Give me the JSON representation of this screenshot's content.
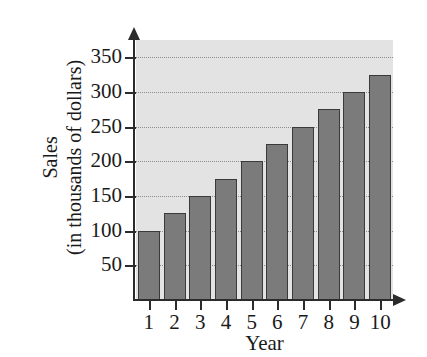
{
  "chart_data": {
    "type": "bar",
    "title": "",
    "xlabel": "Year",
    "ylabel_lines": [
      "Sales",
      "(in thousands of dollars)"
    ],
    "ylabel": "Sales (in thousands of dollars)",
    "categories": [
      "1",
      "2",
      "3",
      "4",
      "5",
      "6",
      "7",
      "8",
      "9",
      "10"
    ],
    "values": [
      100,
      125,
      150,
      175,
      200,
      225,
      250,
      275,
      300,
      325
    ],
    "ylim": [
      0,
      375
    ],
    "yticks": [
      50,
      100,
      150,
      200,
      250,
      300,
      350
    ],
    "ytick_labels": [
      "50",
      "100",
      "150",
      "200",
      "250",
      "300",
      "350"
    ],
    "grid": true,
    "grid_style": "dotted-horizontal",
    "legend": "none",
    "colors": {
      "bar_fill": "#7b7b7b",
      "bar_edge": "#3a3a3a",
      "plot_background": "#e3e3e3",
      "axis": "#2b2b2b",
      "gridline": "#8d8d8d",
      "text": "#1a1a1a",
      "figure_background": "#ffffff"
    }
  }
}
